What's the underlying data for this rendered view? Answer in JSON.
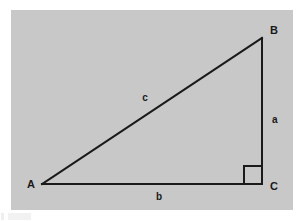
{
  "figure": {
    "name": "right-triangle-diagram",
    "panel": {
      "fill": "#c8c8c8",
      "x": 11,
      "y": 10,
      "width": 282,
      "height": 200
    },
    "page_background": "#ffffff",
    "stroke_color": "#1a1a1a",
    "stroke_width": 2,
    "vertices": [
      {
        "id": "A",
        "label": "A",
        "x": 42,
        "y": 184,
        "label_x": 31,
        "label_y": 188
      },
      {
        "id": "B",
        "label": "B",
        "x": 262,
        "y": 38,
        "label_x": 270,
        "label_y": 34
      },
      {
        "id": "C",
        "label": "C",
        "x": 262,
        "y": 184,
        "label_x": 270,
        "label_y": 190
      }
    ],
    "sides": [
      {
        "id": "a",
        "label": "a",
        "from": "B",
        "to": "C",
        "label_x": 272,
        "label_y": 123,
        "description": "vertical leg"
      },
      {
        "id": "b",
        "label": "b",
        "from": "A",
        "to": "C",
        "label_x": 159,
        "label_y": 200,
        "description": "horizontal leg"
      },
      {
        "id": "c",
        "label": "c",
        "from": "A",
        "to": "B",
        "label_x": 145,
        "label_y": 101,
        "description": "hypotenuse"
      }
    ],
    "right_angle_marker": {
      "at_vertex": "C",
      "size": 18,
      "x": 244,
      "y": 166
    }
  }
}
